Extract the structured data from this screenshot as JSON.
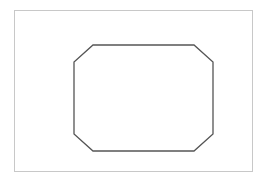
{
  "figure": {
    "canvas": {
      "width": 267,
      "height": 181,
      "background_color": "#ffffff"
    },
    "outer_frame": {
      "name": "outer-frame-rectangle",
      "x": 14.5,
      "y": 10.5,
      "width": 238,
      "height": 161,
      "stroke_color": "#c8c8c8",
      "stroke_width": 1,
      "fill_color": "#ffffff"
    },
    "octagon": {
      "name": "chamfered-rectangle-octagon",
      "sides": 8,
      "stroke_color": "#555555",
      "stroke_width": 1.3,
      "fill_color": "none",
      "bounds": {
        "left": 74,
        "right": 213,
        "top": 45,
        "bottom": 151,
        "width": 139,
        "height": 106
      },
      "chamfer": {
        "horizontal": 19,
        "vertical": 17
      },
      "points": "93,45 194,45 213,62 213,134 194,151 93,151 74,134 74,62",
      "vertices": [
        {
          "label": "top-left-chamfer-end",
          "x": 93,
          "y": 45
        },
        {
          "label": "top-right-chamfer-start",
          "x": 194,
          "y": 45
        },
        {
          "label": "right-top-chamfer-end",
          "x": 213,
          "y": 62
        },
        {
          "label": "right-bottom-chamfer-start",
          "x": 213,
          "y": 134
        },
        {
          "label": "bottom-right-chamfer-end",
          "x": 194,
          "y": 151
        },
        {
          "label": "bottom-left-chamfer-start",
          "x": 93,
          "y": 151
        },
        {
          "label": "left-bottom-chamfer-end",
          "x": 74,
          "y": 134
        },
        {
          "label": "left-top-chamfer-start",
          "x": 74,
          "y": 62
        }
      ]
    }
  }
}
